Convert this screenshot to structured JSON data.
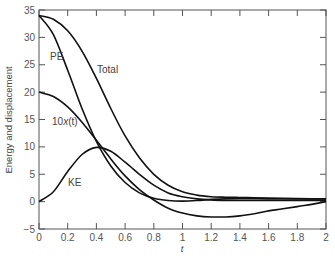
{
  "chart_data": {
    "type": "line",
    "title": "",
    "xlabel": "t",
    "ylabel": "Energy and displacement",
    "xlim": [
      0,
      2
    ],
    "ylim": [
      -5,
      35
    ],
    "grid": false,
    "legend": "inline labels",
    "x_ticks": [
      "0",
      "0.2",
      "0.4",
      "0.6",
      "0.8",
      "1",
      "1.2",
      "1.4",
      "1.6",
      "1.8",
      "2"
    ],
    "y_ticks": [
      "35",
      "30",
      "25",
      "20",
      "15",
      "10",
      "5",
      "0",
      "−5"
    ],
    "x": [
      0,
      0.1,
      0.2,
      0.3,
      0.4,
      0.5,
      0.6,
      0.7,
      0.8,
      0.9,
      1.0,
      1.1,
      1.2,
      1.3,
      1.4,
      1.5,
      1.6,
      1.7,
      1.8,
      1.9,
      2.0
    ],
    "series": [
      {
        "name": "Total",
        "values": [
          34,
          33.3,
          31.2,
          27.5,
          22.5,
          17,
          12,
          8,
          5,
          3,
          1.8,
          1.2,
          0.9,
          0.8,
          0.75,
          0.7,
          0.65,
          0.6,
          0.55,
          0.5,
          0.5
        ]
      },
      {
        "name": "PE",
        "values": [
          34,
          30.5,
          24,
          17,
          11,
          6.5,
          3.5,
          1.6,
          0.6,
          0.2,
          0.1,
          0.2,
          0.4,
          0.5,
          0.55,
          0.55,
          0.5,
          0.5,
          0.5,
          0.5,
          0.5
        ]
      },
      {
        "name": "10x(t)",
        "values": [
          20,
          19.2,
          17.3,
          14.5,
          11.2,
          7.8,
          4.7,
          2.2,
          0.3,
          -1.2,
          -2.1,
          -2.6,
          -2.8,
          -2.8,
          -2.6,
          -2.2,
          -1.7,
          -1.3,
          -0.9,
          -0.5,
          0
        ]
      },
      {
        "name": "KE",
        "values": [
          0,
          1.8,
          5.5,
          8.6,
          9.9,
          9.2,
          7.2,
          5,
          3,
          1.6,
          0.9,
          0.5,
          0.3,
          0.2,
          0.2,
          0.2,
          0.2,
          0.2,
          0.2,
          0.2,
          0.2
        ]
      }
    ],
    "annotations": [
      {
        "text": "PE",
        "x": 0.12,
        "y": 29
      },
      {
        "text": "Total",
        "x": 0.52,
        "y": 25.5
      },
      {
        "text": "10x(t)",
        "x": 0.12,
        "y": 14.5
      },
      {
        "text": "KE",
        "x": 0.33,
        "y": 3.5
      }
    ]
  },
  "labels": {
    "pe": "PE",
    "total": "Total",
    "tenx_prefix": "10",
    "tenx_var": "x",
    "tenx_arg": "(t)",
    "ke": "KE",
    "xlabel": "t",
    "ylabel": "Energy and displacement"
  }
}
